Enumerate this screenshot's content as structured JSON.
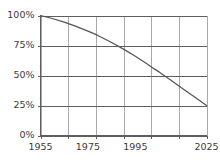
{
  "chart_data": {
    "type": "line",
    "title": "",
    "subtitle": "",
    "xlabel": "",
    "ylabel": "",
    "xlim": [
      1955,
      2025
    ],
    "ylim": [
      0,
      100
    ],
    "grid": true,
    "legend": null,
    "legend_position": "none",
    "background_color": "#ffffff",
    "line_color": "#555555",
    "hgrid_color": "#5e5e5e",
    "vgrid_color": "#a8a8a8",
    "text_color": "#3a3a3a",
    "y_ticks": [
      0,
      25,
      50,
      75,
      100
    ],
    "y_tick_labels": [
      "0%",
      "25%",
      "50%",
      "75%",
      "100%"
    ],
    "x_ticks": [
      1955,
      1966.67,
      1978.33,
      1990,
      2001.67,
      2013.33,
      2025
    ],
    "x_tick_labels_shown": [
      "1955",
      "1975",
      "1995",
      "2025"
    ],
    "x_label_positions": [
      1955,
      1975,
      1995,
      2025
    ],
    "series": [
      {
        "name": "decline",
        "x": [
          1955,
          1960,
          1965,
          1970,
          1975,
          1978,
          1980,
          1985,
          1990,
          1995,
          2000,
          2003,
          2005,
          2010,
          2015,
          2020,
          2025
        ],
        "values": [
          100,
          97.5,
          94.5,
          91.0,
          87.0,
          84.5,
          82.5,
          77.5,
          72.0,
          66.0,
          59.5,
          55.5,
          53.0,
          46.0,
          39.0,
          32.0,
          25.0
        ]
      }
    ],
    "annotations": []
  }
}
